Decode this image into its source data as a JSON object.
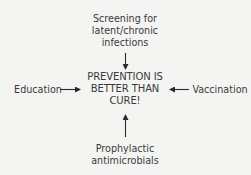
{
  "diagram": {
    "center": {
      "lines": [
        "PREVENTION IS",
        "BETTER THAN",
        "CURE!"
      ]
    },
    "inputs": {
      "top": {
        "lines": [
          "Screening for",
          "latent/chronic",
          "infections"
        ],
        "arrow": "down"
      },
      "left": {
        "lines": [
          "Education"
        ],
        "arrow": "right"
      },
      "right": {
        "lines": [
          "Vaccination"
        ],
        "arrow": "left"
      },
      "bottom": {
        "lines": [
          "Prophylactic",
          "antimicrobials"
        ],
        "arrow": "up"
      }
    }
  }
}
